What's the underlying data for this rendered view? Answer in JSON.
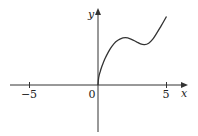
{
  "chart_data": {
    "type": "line",
    "title": "",
    "xlabel": "x",
    "ylabel": "y",
    "xlim": [
      -5,
      5
    ],
    "x_ticks": [
      -5,
      0,
      5
    ],
    "tick_labels": [
      "−5",
      "0",
      "5"
    ],
    "grid": false,
    "legend": null,
    "series": [
      {
        "name": "f",
        "x": [
          0,
          0.05,
          0.15,
          0.3,
          0.5,
          0.75,
          1.0,
          1.3,
          1.6,
          2.0,
          2.4,
          2.8,
          3.1,
          3.4,
          3.7,
          4.0,
          4.3,
          4.6,
          5.0
        ],
        "y": [
          0,
          0.55,
          0.95,
          1.4,
          1.9,
          2.4,
          2.8,
          3.15,
          3.35,
          3.45,
          3.35,
          3.15,
          3.0,
          2.95,
          3.05,
          3.35,
          3.8,
          4.3,
          5.0
        ]
      }
    ]
  },
  "labels": {
    "x_axis": "x",
    "y_axis": "y",
    "tick_neg5": "−5",
    "tick_0": "0",
    "tick_5": "5"
  },
  "colors": {
    "axis": "#333333",
    "curve": "#333333"
  }
}
